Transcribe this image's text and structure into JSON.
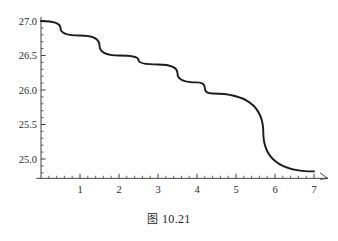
{
  "caption": {
    "prefix": "图",
    "number": "10.21",
    "full": "图 10.21"
  },
  "colors": {
    "curve": "#1c1c1c",
    "axis": "#2b2b2b",
    "background": "#ffffff"
  },
  "chart_data": {
    "type": "line",
    "title": "",
    "subtitle": "",
    "xlabel": "",
    "ylabel": "",
    "xlim": [
      -0.12,
      7.35
    ],
    "ylim": [
      24.72,
      27.06
    ],
    "grid": false,
    "legend": null,
    "legend_position": "none",
    "x_ticks": [
      1,
      2,
      3,
      4,
      5,
      6,
      7
    ],
    "x_tick_labels": [
      "1",
      "2",
      "3",
      "4",
      "5",
      "6",
      "7"
    ],
    "x_minor_tick_step": 0.2,
    "y_ticks": [
      25.0,
      25.5,
      26.0,
      26.5,
      27.0
    ],
    "y_tick_labels": [
      "25.0",
      "25.5",
      "26.0",
      "26.5",
      "27.0"
    ],
    "y_minor_tick_step": 0.1,
    "axes_style": "origin-cross-with-arrow",
    "x_axis_arrow": true,
    "series": [
      {
        "name": "curve",
        "x": [
          0.0,
          1.0,
          2.0,
          3.0,
          4.0,
          4.4,
          7.0
        ],
        "y": [
          27.0,
          26.79,
          26.5,
          26.37,
          26.11,
          25.95,
          24.82
        ],
        "values": [
          27.0,
          26.79,
          26.5,
          26.37,
          26.11,
          25.95,
          24.82
        ]
      }
    ]
  }
}
